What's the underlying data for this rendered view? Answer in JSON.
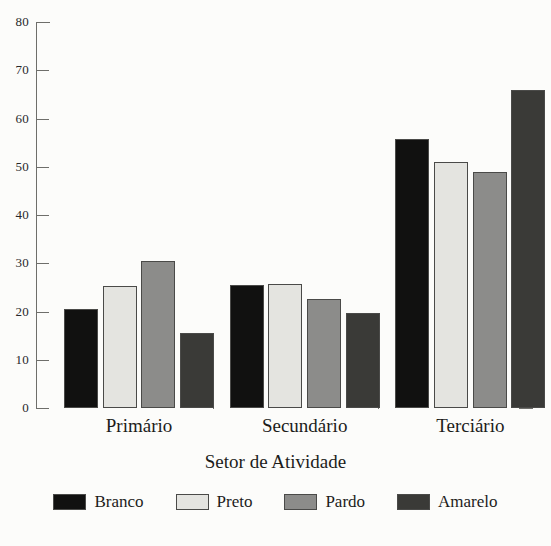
{
  "chart_data": {
    "type": "bar",
    "title": "",
    "subtitle": "",
    "xlabel": "Setor de Atividade",
    "ylabel": "",
    "categories": [
      "Primário",
      "Secundário",
      "Terciário"
    ],
    "series": [
      {
        "name": "Branco",
        "color": "#111110",
        "values": [
          20.5,
          25.5,
          55.8
        ]
      },
      {
        "name": "Preto",
        "color": "#e4e4e0",
        "values": [
          25.3,
          25.8,
          51.0
        ]
      },
      {
        "name": "Pardo",
        "color": "#8c8c8a",
        "values": [
          30.4,
          22.6,
          48.9
        ]
      },
      {
        "name": "Amarelo",
        "color": "#3a3a37",
        "values": [
          15.6,
          19.7,
          66.0
        ]
      }
    ],
    "ylim": [
      0,
      80
    ],
    "ytick_values": [
      0,
      10,
      20,
      30,
      40,
      50,
      60,
      70,
      80
    ],
    "ytick_labels": [
      "0",
      "10",
      "20",
      "30",
      "40",
      "50",
      "60",
      "70",
      "80"
    ],
    "grid": false,
    "legend_position": "bottom",
    "legend_entries": [
      "Branco",
      "Preto",
      "Pardo",
      "Amarelo"
    ],
    "annotations": []
  },
  "figure": {
    "background_color": "#fcfcfa",
    "axis_color": "#6e6e6a",
    "bar_edge_color": "#4a4a48"
  }
}
